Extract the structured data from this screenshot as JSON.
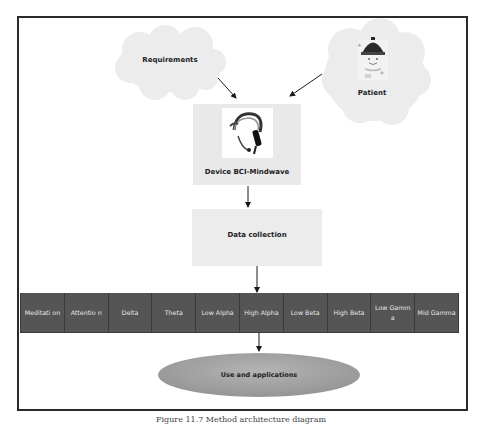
{
  "diagram": {
    "nodes": {
      "requirements": {
        "label": "Requirements",
        "shape": "cloud"
      },
      "patient": {
        "label": "Patient",
        "shape": "cloud",
        "icon": "patient-with-eeg-headset-icon"
      },
      "device": {
        "label": "Device BCI-Mindwave",
        "icon": "mindwave-headset-icon"
      },
      "data_collection": {
        "label": "Data collection"
      },
      "use": {
        "label": "Use and applications",
        "shape": "ellipse"
      }
    },
    "signals": [
      {
        "label": "Meditati on"
      },
      {
        "label": "Attentio n"
      },
      {
        "label": "Delta"
      },
      {
        "label": "Theta"
      },
      {
        "label": "Low Alpha"
      },
      {
        "label": "High Alpha"
      },
      {
        "label": "Low Beta"
      },
      {
        "label": "High Beta"
      },
      {
        "label": "Low Gamma"
      },
      {
        "label": "Mid Gamma"
      }
    ],
    "edges": [
      {
        "from": "requirements",
        "to": "device"
      },
      {
        "from": "patient",
        "to": "device"
      },
      {
        "from": "device",
        "to": "data_collection"
      },
      {
        "from": "data_collection",
        "to": "signals"
      },
      {
        "from": "signals",
        "to": "use"
      }
    ],
    "colors": {
      "cloud": "#ececec",
      "box": "#eaeaea",
      "signal_cell": "#555555",
      "signal_text": "#e6e6e6",
      "ellipse": "#a3a3a3",
      "frame": "#2b2b2b"
    }
  },
  "caption": "Figure 11.7  Method architecture diagram"
}
